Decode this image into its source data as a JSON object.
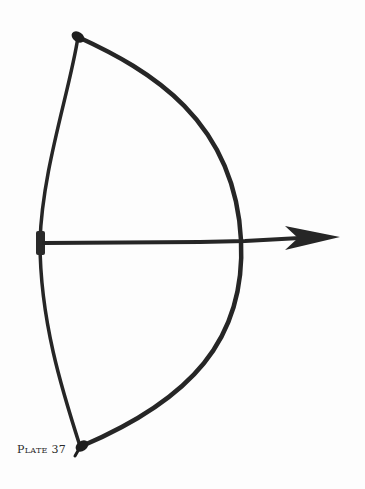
{
  "caption": {
    "label": "Plate 37"
  },
  "image": {
    "subject": "bow-and-arrow",
    "background": "#fdfdfd",
    "ink": "#262626"
  }
}
